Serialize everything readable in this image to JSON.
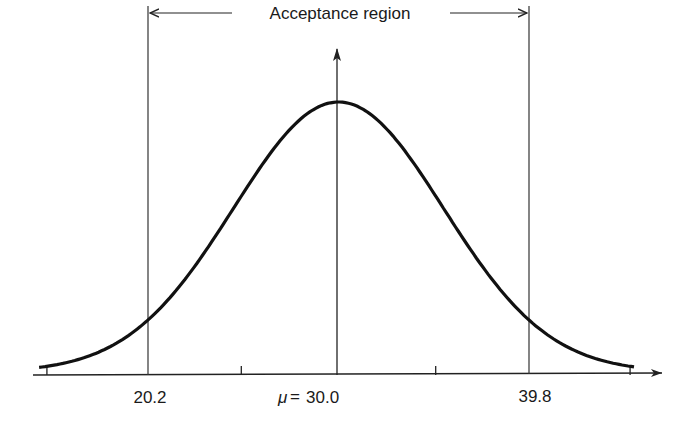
{
  "chart_data": {
    "type": "line",
    "title": "",
    "distribution": {
      "kind": "normal",
      "mean": 30.0,
      "sigma": 5.0
    },
    "x_range": [
      15.0,
      45.0
    ],
    "xlabel": "",
    "ylabel": "",
    "tick_positions": [
      15.0,
      25.0,
      30.0,
      35.0,
      45.0
    ],
    "tick_labels": [
      {
        "x": 20.2,
        "label": "20.2"
      },
      {
        "x": 30.0,
        "label": "μ = 30.0",
        "prefix": "μ",
        "value": "30.0"
      },
      {
        "x": 39.8,
        "label": "39.8"
      }
    ],
    "vertical_lines": [
      20.2,
      30.0,
      39.8
    ],
    "acceptance_region": {
      "from": 20.2,
      "to": 39.8,
      "label": "Acceptance region"
    },
    "grid": false,
    "legend": null
  },
  "labels": {
    "acceptance_region": "Acceptance region",
    "lower_bound": "20.2",
    "mean_symbol": "μ",
    "mean_equals": "=",
    "mean_value": "30.0",
    "upper_bound": "39.8"
  },
  "colors": {
    "curve": "#111111",
    "axis": "#222222",
    "lines": "#333333",
    "background": "#ffffff"
  }
}
